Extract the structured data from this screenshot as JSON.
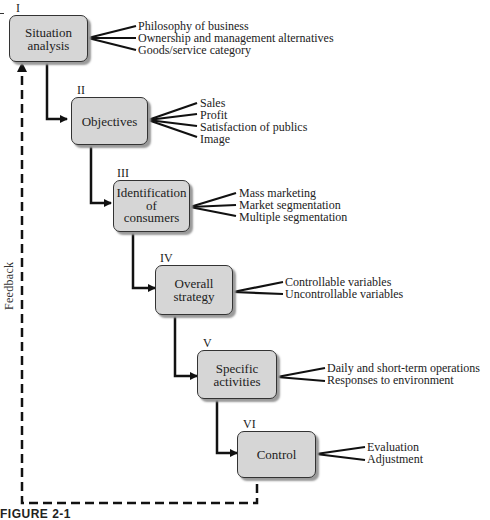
{
  "diagram": {
    "stages": [
      {
        "numeral": "I",
        "title_lines": [
          "Situation",
          "analysis"
        ],
        "items": [
          "Philosophy of business",
          "Ownership and management alternatives",
          "Goods/service category"
        ]
      },
      {
        "numeral": "II",
        "title_lines": [
          "Objectives"
        ],
        "items": [
          "Sales",
          "Profit",
          "Satisfaction of publics",
          "Image"
        ]
      },
      {
        "numeral": "III",
        "title_lines": [
          "Identification",
          "of",
          "consumers"
        ],
        "items": [
          "Mass marketing",
          "Market segmentation",
          "Multiple segmentation"
        ]
      },
      {
        "numeral": "IV",
        "title_lines": [
          "Overall",
          "strategy"
        ],
        "items": [
          "Controllable variables",
          "Uncontrollable variables"
        ]
      },
      {
        "numeral": "V",
        "title_lines": [
          "Specific",
          "activities"
        ],
        "items": [
          "Daily and short-term operations",
          "Responses to environment"
        ]
      },
      {
        "numeral": "VI",
        "title_lines": [
          "Control"
        ],
        "items": [
          "Evaluation",
          "Adjustment"
        ]
      }
    ],
    "feedback_label": "Feedback",
    "caption": "FIGURE 2-1"
  },
  "colors": {
    "box_fill": "#d6d6d6",
    "line": "#111111"
  }
}
